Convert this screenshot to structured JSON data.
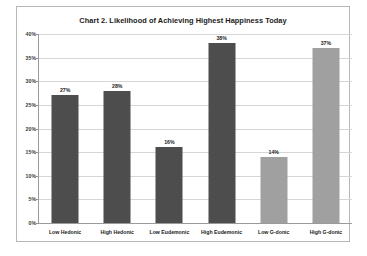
{
  "chart_data": {
    "type": "bar",
    "title": "Chart 2. Likelihood of Achieving Highest Happiness Today",
    "xlabel": "",
    "ylabel": "",
    "categories": [
      "Low Hedonic",
      "High Hedonic",
      "Low Eudemonic",
      "High Eudemonic",
      "Low G-donic",
      "High G-donic"
    ],
    "values": [
      27,
      28,
      16,
      38,
      14,
      37
    ],
    "value_labels": [
      "27%",
      "28%",
      "16%",
      "38%",
      "14%",
      "37%"
    ],
    "bar_colors": [
      "#4d4d4d",
      "#4d4d4d",
      "#4d4d4d",
      "#4d4d4d",
      "#a0a0a0",
      "#a0a0a0"
    ],
    "ylim": [
      0,
      40
    ],
    "ytick_values": [
      0,
      5,
      10,
      15,
      20,
      25,
      30,
      35,
      40
    ],
    "ytick_labels": [
      "0%",
      "5%",
      "10%",
      "15%",
      "20%",
      "25%",
      "30%",
      "35%",
      "40%"
    ],
    "grid": true,
    "legend": false,
    "legend_position": "none",
    "plot_background": "#ffffff",
    "gridline_color": "#d6d6d6",
    "axis_color": "#9a9a9a",
    "frame_border_color": "#b8b8b8"
  }
}
